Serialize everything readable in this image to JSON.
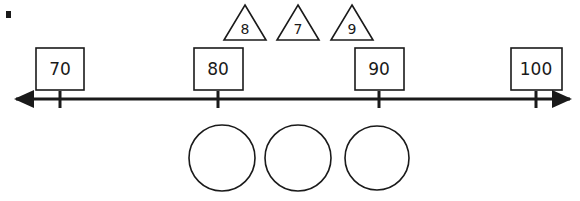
{
  "diagram": {
    "type": "number-line-worksheet",
    "stroke_color": "#1a1a1a",
    "background_color": "#ffffff",
    "corner_mark": {
      "name": "bullet-mark",
      "x": 6,
      "y": 11,
      "width": 5,
      "height": 7
    },
    "number_line": {
      "y": 99,
      "x_start": 16,
      "x_end": 570,
      "left_arrow": true,
      "right_arrow": true,
      "ticks": [
        {
          "label": "70",
          "x": 60
        },
        {
          "label": "80",
          "x": 218
        },
        {
          "label": "90",
          "x": 379
        },
        {
          "label": "100",
          "x": 536
        }
      ]
    },
    "boxes": [
      {
        "value": "70",
        "x": 36,
        "y": 48,
        "width": 48,
        "height": 42
      },
      {
        "value": "80",
        "x": 194,
        "y": 48,
        "width": 49,
        "height": 42
      },
      {
        "value": "90",
        "x": 355,
        "y": 48,
        "width": 49,
        "height": 42
      },
      {
        "value": "100",
        "x": 511,
        "y": 48,
        "width": 51,
        "height": 42
      }
    ],
    "triangles": [
      {
        "value": "8",
        "cx": 245,
        "top_y": 5,
        "bottom_y": 40,
        "half_width": 21
      },
      {
        "value": "7",
        "cx": 298,
        "top_y": 5,
        "bottom_y": 40,
        "half_width": 21
      },
      {
        "value": "9",
        "cx": 352,
        "top_y": 5,
        "bottom_y": 40,
        "half_width": 21
      }
    ],
    "circles": [
      {
        "cx": 222,
        "cy": 158,
        "r": 33
      },
      {
        "cx": 298,
        "cy": 158,
        "r": 33
      },
      {
        "cx": 377,
        "cy": 158,
        "r": 32
      }
    ]
  }
}
